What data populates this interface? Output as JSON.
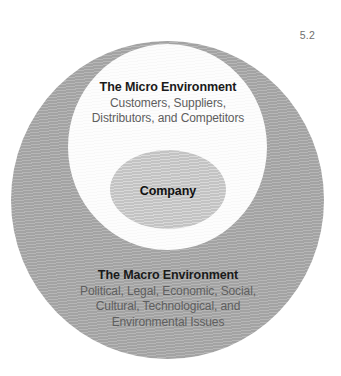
{
  "figure": {
    "number": "5.2"
  },
  "diagram": {
    "type": "concentric-circles",
    "colors": {
      "macro_ring": "#a9a9a9",
      "micro_disc": "#fbfbfb",
      "company_disc": "#c9c9c9",
      "heading_text": "#1a1a1a",
      "body_text": "#5e5e5e",
      "background": "#ffffff"
    },
    "layers": {
      "macro": {
        "heading": "The Macro Environment",
        "lines": [
          "Political, Legal, Economic, Social,",
          "Cultural, Technological, and",
          "Environmental Issues"
        ]
      },
      "micro": {
        "heading": "The Micro Environment",
        "lines": [
          "Customers, Suppliers,",
          "Distributors, and Competitors"
        ]
      },
      "company": {
        "heading": "Company",
        "lines": []
      }
    }
  }
}
